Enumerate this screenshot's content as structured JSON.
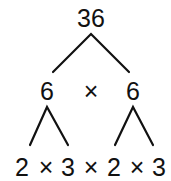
{
  "tree": {
    "root": "36",
    "level1": {
      "left": "6",
      "op": "×",
      "right": "6"
    },
    "level2": [
      "2",
      "×",
      "3",
      "×",
      "2",
      "×",
      "3"
    ]
  }
}
